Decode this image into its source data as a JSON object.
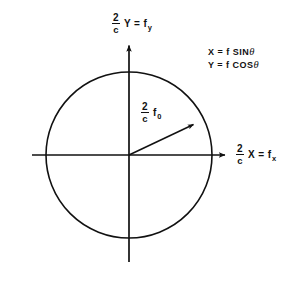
{
  "figure": {
    "type": "vector-diagram",
    "background_color": "#ffffff",
    "ink_color": "#111111"
  },
  "axes": {
    "y_axis": {
      "name": "vertical-axis",
      "fraction_numerator": "2",
      "fraction_denominator": "c",
      "expression": "Y = f",
      "subscript": "y"
    },
    "x_axis": {
      "name": "horizontal-axis",
      "fraction_numerator": "2",
      "fraction_denominator": "c",
      "expression": "X = f",
      "subscript": "x"
    }
  },
  "radius_vector": {
    "fraction_numerator": "2",
    "fraction_denominator": "c",
    "expression": "f",
    "subscript": "0"
  },
  "equations": {
    "line1": "X = f SIN",
    "line1_symbol": "θ",
    "line2": "Y = f COS",
    "line2_symbol": "θ"
  },
  "geometry": {
    "origin_x": 129,
    "origin_y": 155,
    "circle_radius": 83,
    "x_axis_start_x": 32,
    "x_axis_end_x": 228,
    "y_axis_top_y": 42,
    "y_axis_bottom_y": 262,
    "vector_angle_degrees": 39,
    "vector_tip_x": 196,
    "vector_tip_y": 122,
    "stroke_width": 1.6
  }
}
